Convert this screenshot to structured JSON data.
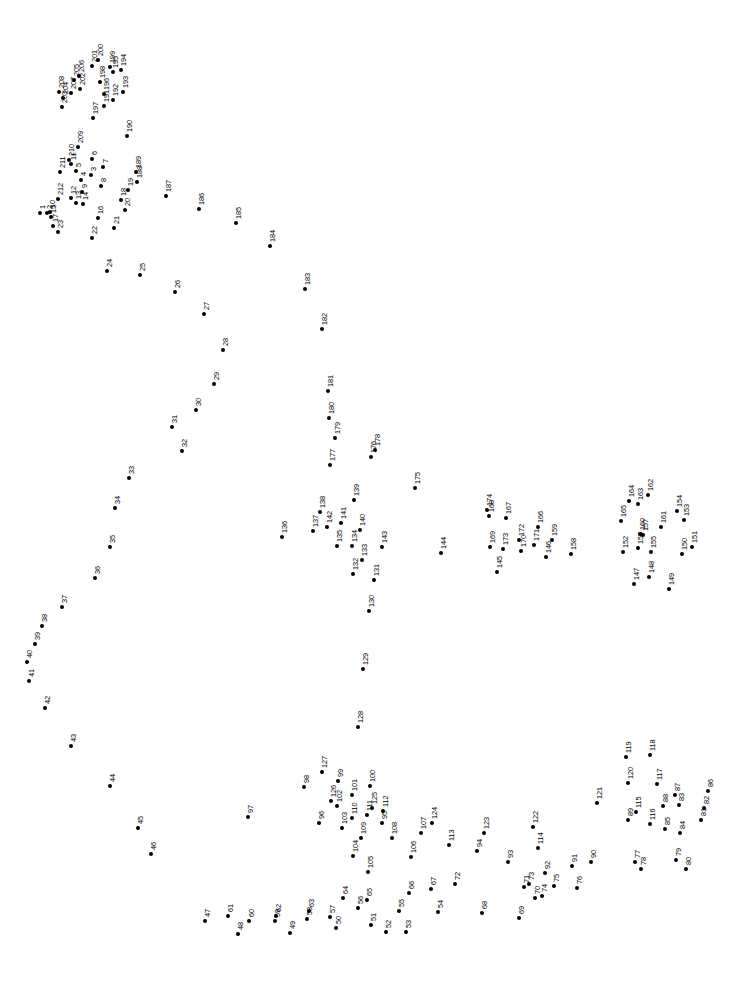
{
  "page": {
    "background_color": "#ffffff",
    "dot_color": "#000000",
    "label_color": "#000000",
    "label_rotation_degrees": -90,
    "width": 732,
    "height": 988,
    "total_dots": 212
  },
  "dots": [
    {
      "n": "1",
      "x": 40,
      "y": 213
    },
    {
      "n": "2",
      "x": 47,
      "y": 213
    },
    {
      "n": "3",
      "x": 91,
      "y": 175
    },
    {
      "n": "4",
      "x": 81,
      "y": 180
    },
    {
      "n": "5",
      "x": 76,
      "y": 171
    },
    {
      "n": "6",
      "x": 92,
      "y": 159
    },
    {
      "n": "7",
      "x": 103,
      "y": 167
    },
    {
      "n": "8",
      "x": 101,
      "y": 186
    },
    {
      "n": "9",
      "x": 82,
      "y": 192
    },
    {
      "n": "10",
      "x": 50,
      "y": 212
    },
    {
      "n": "11",
      "x": 71,
      "y": 164
    },
    {
      "n": "12",
      "x": 71,
      "y": 198
    },
    {
      "n": "13",
      "x": 76,
      "y": 203
    },
    {
      "n": "14",
      "x": 83,
      "y": 204
    },
    {
      "n": "15",
      "x": 51,
      "y": 217
    },
    {
      "n": "16",
      "x": 98,
      "y": 218
    },
    {
      "n": "17",
      "x": 53,
      "y": 226
    },
    {
      "n": "18",
      "x": 121,
      "y": 200
    },
    {
      "n": "19",
      "x": 128,
      "y": 190
    },
    {
      "n": "20",
      "x": 125,
      "y": 210
    },
    {
      "n": "21",
      "x": 114,
      "y": 228
    },
    {
      "n": "22",
      "x": 92,
      "y": 238
    },
    {
      "n": "23",
      "x": 58,
      "y": 232
    },
    {
      "n": "24",
      "x": 107,
      "y": 271
    },
    {
      "n": "25",
      "x": 140,
      "y": 275
    },
    {
      "n": "26",
      "x": 175,
      "y": 292
    },
    {
      "n": "27",
      "x": 204,
      "y": 314
    },
    {
      "n": "28",
      "x": 223,
      "y": 350
    },
    {
      "n": "29",
      "x": 214,
      "y": 384
    },
    {
      "n": "30",
      "x": 196,
      "y": 410
    },
    {
      "n": "31",
      "x": 172,
      "y": 427
    },
    {
      "n": "32",
      "x": 182,
      "y": 451
    },
    {
      "n": "33",
      "x": 129,
      "y": 478
    },
    {
      "n": "34",
      "x": 115,
      "y": 508
    },
    {
      "n": "35",
      "x": 110,
      "y": 547
    },
    {
      "n": "36",
      "x": 95,
      "y": 578
    },
    {
      "n": "37",
      "x": 62,
      "y": 607
    },
    {
      "n": "38",
      "x": 42,
      "y": 626
    },
    {
      "n": "39",
      "x": 35,
      "y": 644
    },
    {
      "n": "40",
      "x": 27,
      "y": 662
    },
    {
      "n": "41",
      "x": 29,
      "y": 681
    },
    {
      "n": "42",
      "x": 45,
      "y": 708
    },
    {
      "n": "43",
      "x": 71,
      "y": 746
    },
    {
      "n": "44",
      "x": 110,
      "y": 786
    },
    {
      "n": "45",
      "x": 138,
      "y": 828
    },
    {
      "n": "46",
      "x": 151,
      "y": 854
    },
    {
      "n": "47",
      "x": 205,
      "y": 921
    },
    {
      "n": "48",
      "x": 238,
      "y": 934
    },
    {
      "n": "49",
      "x": 290,
      "y": 933
    },
    {
      "n": "50",
      "x": 336,
      "y": 928
    },
    {
      "n": "51",
      "x": 371,
      "y": 925
    },
    {
      "n": "52",
      "x": 386,
      "y": 932
    },
    {
      "n": "53",
      "x": 406,
      "y": 932
    },
    {
      "n": "54",
      "x": 438,
      "y": 912
    },
    {
      "n": "55",
      "x": 399,
      "y": 911
    },
    {
      "n": "56",
      "x": 358,
      "y": 908
    },
    {
      "n": "57",
      "x": 330,
      "y": 917
    },
    {
      "n": "58",
      "x": 307,
      "y": 919
    },
    {
      "n": "59",
      "x": 275,
      "y": 921
    },
    {
      "n": "60",
      "x": 249,
      "y": 921
    },
    {
      "n": "61",
      "x": 228,
      "y": 916
    },
    {
      "n": "62",
      "x": 276,
      "y": 916
    },
    {
      "n": "63",
      "x": 309,
      "y": 911
    },
    {
      "n": "64",
      "x": 343,
      "y": 898
    },
    {
      "n": "65",
      "x": 367,
      "y": 900
    },
    {
      "n": "66",
      "x": 409,
      "y": 893
    },
    {
      "n": "67",
      "x": 431,
      "y": 889
    },
    {
      "n": "68",
      "x": 482,
      "y": 913
    },
    {
      "n": "69",
      "x": 519,
      "y": 918
    },
    {
      "n": "70",
      "x": 535,
      "y": 898
    },
    {
      "n": "71",
      "x": 524,
      "y": 887
    },
    {
      "n": "72",
      "x": 455,
      "y": 884
    },
    {
      "n": "73",
      "x": 529,
      "y": 884
    },
    {
      "n": "74",
      "x": 542,
      "y": 896
    },
    {
      "n": "75",
      "x": 554,
      "y": 886
    },
    {
      "n": "76",
      "x": 577,
      "y": 888
    },
    {
      "n": "77",
      "x": 635,
      "y": 862
    },
    {
      "n": "78",
      "x": 641,
      "y": 869
    },
    {
      "n": "79",
      "x": 676,
      "y": 860
    },
    {
      "n": "80",
      "x": 686,
      "y": 869
    },
    {
      "n": "81",
      "x": 701,
      "y": 820
    },
    {
      "n": "82",
      "x": 704,
      "y": 808
    },
    {
      "n": "83",
      "x": 679,
      "y": 805
    },
    {
      "n": "84",
      "x": 680,
      "y": 833
    },
    {
      "n": "85",
      "x": 665,
      "y": 829
    },
    {
      "n": "86",
      "x": 708,
      "y": 791
    },
    {
      "n": "87",
      "x": 675,
      "y": 795
    },
    {
      "n": "88",
      "x": 663,
      "y": 806
    },
    {
      "n": "89",
      "x": 628,
      "y": 820
    },
    {
      "n": "90",
      "x": 591,
      "y": 862
    },
    {
      "n": "91",
      "x": 572,
      "y": 866
    },
    {
      "n": "92",
      "x": 545,
      "y": 873
    },
    {
      "n": "93",
      "x": 508,
      "y": 862
    },
    {
      "n": "94",
      "x": 477,
      "y": 851
    },
    {
      "n": "95",
      "x": 382,
      "y": 823
    },
    {
      "n": "96",
      "x": 319,
      "y": 823
    },
    {
      "n": "97",
      "x": 248,
      "y": 817
    },
    {
      "n": "98",
      "x": 304,
      "y": 787
    },
    {
      "n": "99",
      "x": 338,
      "y": 781
    },
    {
      "n": "100",
      "x": 370,
      "y": 786
    },
    {
      "n": "101",
      "x": 352,
      "y": 795
    },
    {
      "n": "102",
      "x": 337,
      "y": 806
    },
    {
      "n": "103",
      "x": 342,
      "y": 828
    },
    {
      "n": "104",
      "x": 353,
      "y": 856
    },
    {
      "n": "105",
      "x": 368,
      "y": 872
    },
    {
      "n": "106",
      "x": 411,
      "y": 857
    },
    {
      "n": "107",
      "x": 421,
      "y": 833
    },
    {
      "n": "108",
      "x": 392,
      "y": 838
    },
    {
      "n": "109",
      "x": 361,
      "y": 838
    },
    {
      "n": "110",
      "x": 352,
      "y": 818
    },
    {
      "n": "111",
      "x": 367,
      "y": 815
    },
    {
      "n": "112",
      "x": 383,
      "y": 811
    },
    {
      "n": "113",
      "x": 449,
      "y": 845
    },
    {
      "n": "114",
      "x": 538,
      "y": 848
    },
    {
      "n": "115",
      "x": 636,
      "y": 812
    },
    {
      "n": "116",
      "x": 650,
      "y": 824
    },
    {
      "n": "117",
      "x": 657,
      "y": 784
    },
    {
      "n": "118",
      "x": 650,
      "y": 755
    },
    {
      "n": "119",
      "x": 626,
      "y": 757
    },
    {
      "n": "120",
      "x": 628,
      "y": 783
    },
    {
      "n": "121",
      "x": 597,
      "y": 803
    },
    {
      "n": "122",
      "x": 533,
      "y": 827
    },
    {
      "n": "123",
      "x": 484,
      "y": 833
    },
    {
      "n": "124",
      "x": 432,
      "y": 823
    },
    {
      "n": "125",
      "x": 372,
      "y": 808
    },
    {
      "n": "126",
      "x": 331,
      "y": 801
    },
    {
      "n": "127",
      "x": 322,
      "y": 772
    },
    {
      "n": "128",
      "x": 358,
      "y": 727
    },
    {
      "n": "129",
      "x": 363,
      "y": 669
    },
    {
      "n": "130",
      "x": 369,
      "y": 611
    },
    {
      "n": "131",
      "x": 374,
      "y": 580
    },
    {
      "n": "132",
      "x": 353,
      "y": 574
    },
    {
      "n": "133",
      "x": 362,
      "y": 560
    },
    {
      "n": "134",
      "x": 352,
      "y": 546
    },
    {
      "n": "135",
      "x": 337,
      "y": 546
    },
    {
      "n": "136",
      "x": 282,
      "y": 537
    },
    {
      "n": "137",
      "x": 313,
      "y": 531
    },
    {
      "n": "138",
      "x": 320,
      "y": 512
    },
    {
      "n": "139",
      "x": 354,
      "y": 500
    },
    {
      "n": "140",
      "x": 360,
      "y": 530
    },
    {
      "n": "141",
      "x": 341,
      "y": 523
    },
    {
      "n": "142",
      "x": 327,
      "y": 527
    },
    {
      "n": "143",
      "x": 382,
      "y": 547
    },
    {
      "n": "144",
      "x": 441,
      "y": 553
    },
    {
      "n": "145",
      "x": 497,
      "y": 572
    },
    {
      "n": "146",
      "x": 546,
      "y": 557
    },
    {
      "n": "147",
      "x": 634,
      "y": 584
    },
    {
      "n": "148",
      "x": 649,
      "y": 577
    },
    {
      "n": "149",
      "x": 669,
      "y": 589
    },
    {
      "n": "150",
      "x": 682,
      "y": 554
    },
    {
      "n": "151",
      "x": 692,
      "y": 547
    },
    {
      "n": "152",
      "x": 623,
      "y": 552
    },
    {
      "n": "153",
      "x": 684,
      "y": 520
    },
    {
      "n": "154",
      "x": 677,
      "y": 511
    },
    {
      "n": "155",
      "x": 651,
      "y": 552
    },
    {
      "n": "156",
      "x": 638,
      "y": 548
    },
    {
      "n": "157",
      "x": 643,
      "y": 535
    },
    {
      "n": "158",
      "x": 571,
      "y": 554
    },
    {
      "n": "159",
      "x": 552,
      "y": 540
    },
    {
      "n": "160",
      "x": 640,
      "y": 534
    },
    {
      "n": "161",
      "x": 661,
      "y": 527
    },
    {
      "n": "162",
      "x": 648,
      "y": 495
    },
    {
      "n": "163",
      "x": 638,
      "y": 504
    },
    {
      "n": "164",
      "x": 629,
      "y": 501
    },
    {
      "n": "165",
      "x": 621,
      "y": 521
    },
    {
      "n": "166",
      "x": 538,
      "y": 527
    },
    {
      "n": "167",
      "x": 506,
      "y": 518
    },
    {
      "n": "168",
      "x": 489,
      "y": 516
    },
    {
      "n": "169",
      "x": 490,
      "y": 547
    },
    {
      "n": "170",
      "x": 521,
      "y": 551
    },
    {
      "n": "171",
      "x": 534,
      "y": 545
    },
    {
      "n": "172",
      "x": 519,
      "y": 540
    },
    {
      "n": "173",
      "x": 503,
      "y": 549
    },
    {
      "n": "174",
      "x": 487,
      "y": 510
    },
    {
      "n": "175",
      "x": 415,
      "y": 488
    },
    {
      "n": "176",
      "x": 371,
      "y": 457
    },
    {
      "n": "177",
      "x": 330,
      "y": 465
    },
    {
      "n": "178",
      "x": 375,
      "y": 450
    },
    {
      "n": "179",
      "x": 335,
      "y": 438
    },
    {
      "n": "180",
      "x": 329,
      "y": 418
    },
    {
      "n": "181",
      "x": 328,
      "y": 391
    },
    {
      "n": "182",
      "x": 322,
      "y": 329
    },
    {
      "n": "183",
      "x": 305,
      "y": 289
    },
    {
      "n": "184",
      "x": 270,
      "y": 246
    },
    {
      "n": "185",
      "x": 236,
      "y": 223
    },
    {
      "n": "186",
      "x": 199,
      "y": 209
    },
    {
      "n": "187",
      "x": 166,
      "y": 196
    },
    {
      "n": "188",
      "x": 137,
      "y": 182
    },
    {
      "n": "189",
      "x": 136,
      "y": 172
    },
    {
      "n": "190",
      "x": 127,
      "y": 136
    },
    {
      "n": "191",
      "x": 104,
      "y": 106
    },
    {
      "n": "192",
      "x": 113,
      "y": 100
    },
    {
      "n": "193",
      "x": 123,
      "y": 92
    },
    {
      "n": "194",
      "x": 121,
      "y": 70
    },
    {
      "n": "195",
      "x": 113,
      "y": 72
    },
    {
      "n": "196",
      "x": 104,
      "y": 94
    },
    {
      "n": "197",
      "x": 93,
      "y": 118
    },
    {
      "n": "198",
      "x": 100,
      "y": 82
    },
    {
      "n": "199",
      "x": 110,
      "y": 67
    },
    {
      "n": "200",
      "x": 98,
      "y": 60
    },
    {
      "n": "201",
      "x": 92,
      "y": 66
    },
    {
      "n": "202",
      "x": 80,
      "y": 89
    },
    {
      "n": "203",
      "x": 62,
      "y": 107
    },
    {
      "n": "204",
      "x": 63,
      "y": 98
    },
    {
      "n": "205",
      "x": 74,
      "y": 80
    },
    {
      "n": "206",
      "x": 79,
      "y": 76
    },
    {
      "n": "207",
      "x": 71,
      "y": 93
    },
    {
      "n": "208",
      "x": 59,
      "y": 92
    },
    {
      "n": "209",
      "x": 78,
      "y": 147
    },
    {
      "n": "210",
      "x": 69,
      "y": 160
    },
    {
      "n": "211",
      "x": 60,
      "y": 172
    },
    {
      "n": "212",
      "x": 58,
      "y": 199
    }
  ]
}
